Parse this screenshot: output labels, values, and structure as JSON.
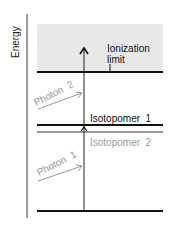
{
  "axis": {
    "label": "Energy"
  },
  "levels": {
    "ionization": {
      "label_line1": "Ionization",
      "label_line2": "limit"
    },
    "isotopomer1": {
      "label": "Isotopomer  1"
    },
    "isotopomer2": {
      "label": "Isotopomer  2"
    }
  },
  "photons": {
    "photon1": {
      "label": "Photon  1"
    },
    "photon2": {
      "label": "Photon  2"
    }
  },
  "colors": {
    "continuum_fill": "#e8e8e8",
    "dark_line": "#111111",
    "gray_line": "#9a9a9a",
    "gray_text": "#9a9a9a"
  }
}
